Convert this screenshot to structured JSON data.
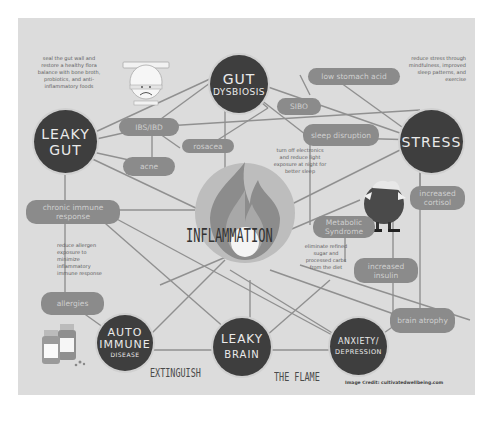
{
  "title": "INFLAMMATION",
  "tagline": {
    "left": "EXTINGUISH",
    "right": "THE FLAME"
  },
  "credit": "Image Credit: cultivatedwellbeing.com",
  "colors": {
    "panel": "#dcdcdc",
    "node": "#3e3e3e",
    "pill": "#8b8b8b",
    "line": "#909090",
    "flame_outer": "#a8a8a8",
    "flame_inner": "#cfcfcf"
  },
  "nodes": [
    {
      "id": "gut_dysbiosis",
      "line1": "GUT",
      "line2": "DYSBIOSIS"
    },
    {
      "id": "leaky_gut",
      "line1": "LEAKY",
      "line2": "GUT"
    },
    {
      "id": "stress",
      "line1": "STRESS",
      "line2": ""
    },
    {
      "id": "auto_immune",
      "line1": "AUTO",
      "line2": "IMMUNE",
      "line3": "DISEASE"
    },
    {
      "id": "leaky_brain",
      "line1": "LEAKY",
      "line2": "BRAIN"
    },
    {
      "id": "anxiety",
      "line1": "ANXIETY/",
      "line2": "DEPRESSION"
    }
  ],
  "pills": [
    {
      "id": "low_stomach_acid",
      "label": "low stomach acid"
    },
    {
      "id": "sibo",
      "label": "SIBO"
    },
    {
      "id": "ibs_ibd",
      "label": "IBS/IBD"
    },
    {
      "id": "rosacea",
      "label": "rosacea"
    },
    {
      "id": "acne",
      "label": "acne"
    },
    {
      "id": "sleep_disruption",
      "label": "sleep disruption"
    },
    {
      "id": "chronic_immune",
      "label": "chronic immune response"
    },
    {
      "id": "metabolic_syndrome",
      "label": "Metabolic Syndrome"
    },
    {
      "id": "increased_cortisol",
      "label": "increased cortisol"
    },
    {
      "id": "increased_insulin",
      "label": "increased insulin"
    },
    {
      "id": "allergies",
      "label": "allergies"
    },
    {
      "id": "brain_atrophy",
      "label": "brain atrophy"
    }
  ],
  "notes": {
    "gut": "seal the gut wall and restore a healthy flora balance with bone broth, probiotics, and anti-inflammatory foods",
    "stress": "reduce stress through mindfulness, improved sleep patterns, and exercise",
    "sleep": "turn off electronics and reduce light exposure at night for better sleep",
    "allergy": "reduce allergen exposure to minimize inflammatory immune response",
    "sugar": "eliminate refined sugar and processed carbs from the diet"
  },
  "icons": [
    "sad-toilet-icon",
    "stressed-man-icon",
    "medicine-bottles-icon",
    "flame-icon"
  ]
}
